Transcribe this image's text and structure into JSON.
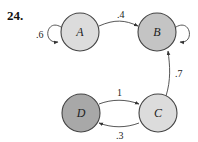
{
  "problem": {
    "number": "24."
  },
  "nodes": [
    {
      "id": "A",
      "label": "A",
      "fill": "#dcdcdc"
    },
    {
      "id": "B",
      "label": "B",
      "fill": "#c4c4c4"
    },
    {
      "id": "C",
      "label": "C",
      "fill": "#dcdcdc"
    },
    {
      "id": "D",
      "label": "D",
      "fill": "#a8a8a8"
    }
  ],
  "edges": [
    {
      "from": "A",
      "to": "A",
      "label": ".6"
    },
    {
      "from": "A",
      "to": "B",
      "label": ".4"
    },
    {
      "from": "B",
      "to": "B",
      "label": ""
    },
    {
      "from": "C",
      "to": "B",
      "label": ".7"
    },
    {
      "from": "D",
      "to": "C",
      "label": "1"
    },
    {
      "from": "C",
      "to": "D",
      "label": ".3"
    }
  ]
}
